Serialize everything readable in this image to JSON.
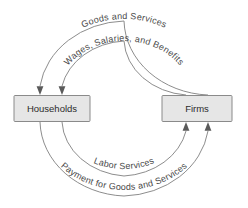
{
  "diagram": {
    "type": "circular-flow",
    "background_color": "#ffffff",
    "line_color": "#8d8d8d",
    "box_fill_color": "#e6e6e6",
    "box_border_color": "#8a8a8a",
    "text_color": "#4a4a4a",
    "entities": [
      {
        "id": "households",
        "label": "Households",
        "position": "left"
      },
      {
        "id": "firms",
        "label": "Firms",
        "position": "right"
      }
    ],
    "flows": [
      {
        "id": "goods-and-services",
        "label": "Goods and Services",
        "arc": "outer-top",
        "direction": "firms-to-households"
      },
      {
        "id": "wages-salaries-benefits",
        "label": "Wages, Salaries, and Benefits",
        "arc": "inner-top",
        "direction": "firms-to-households"
      },
      {
        "id": "labor-services",
        "label": "Labor Services",
        "arc": "inner-bottom",
        "direction": "households-to-firms"
      },
      {
        "id": "payment-for-goods-and-services",
        "label": "Payment for Goods and Services",
        "arc": "outer-bottom",
        "direction": "households-to-firms"
      }
    ]
  }
}
